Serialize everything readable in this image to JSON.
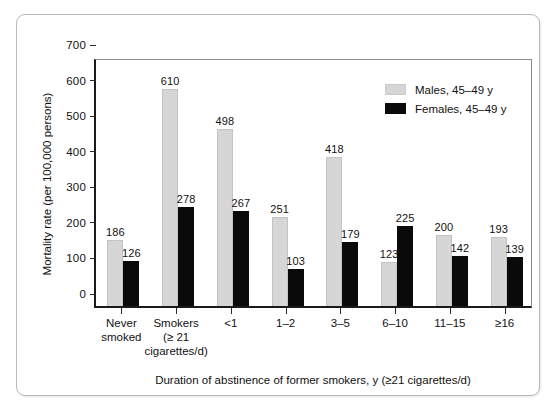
{
  "chart_data": {
    "type": "bar",
    "title": "",
    "xlabel": "Duration of abstinence of former smokers, y (≥21 cigarettes/d)",
    "ylabel": "Mortality rate (per 100,000 persons)",
    "ylim": [
      0,
      700
    ],
    "yticks": [
      0,
      100,
      200,
      300,
      400,
      500,
      600,
      700
    ],
    "ytick_labels": [
      "0",
      "100",
      "200",
      "300",
      "400",
      "500",
      "600",
      "700"
    ],
    "grid": false,
    "legend_position": "top-right",
    "categories": [
      "Never smoked",
      "Smokers (≥ 21 cigarettes/d)",
      "<1",
      "1–2",
      "3–5",
      "6–10",
      "11–15",
      "≥16"
    ],
    "category_lines": [
      [
        "Never",
        "smoked",
        ""
      ],
      [
        "Smokers",
        "(≥ 21",
        "cigarettes/d)"
      ],
      [
        "<1",
        "",
        ""
      ],
      [
        "1–2",
        "",
        ""
      ],
      [
        "3–5",
        "",
        ""
      ],
      [
        "6–10",
        "",
        ""
      ],
      [
        "11–15",
        "",
        ""
      ],
      [
        "≥16",
        "",
        ""
      ]
    ],
    "series": [
      {
        "name": "Males, 45–49 y",
        "color": "#d6d6d6",
        "values": [
          186,
          610,
          498,
          251,
          418,
          123,
          200,
          193
        ]
      },
      {
        "name": "Females, 45–49 y",
        "color": "#0a0a0a",
        "values": [
          126,
          278,
          267,
          103,
          179,
          225,
          142,
          139
        ]
      }
    ]
  },
  "legend": {
    "items": [
      {
        "label": "Males, 45–49 y",
        "swatch": "male"
      },
      {
        "label": "Females, 45–49 y",
        "swatch": "female"
      }
    ]
  },
  "axes": {
    "y_title": "Mortality rate (per 100,000 persons)",
    "x_title": "Duration of abstinence of former smokers, y (≥21 cigarettes/d)"
  }
}
